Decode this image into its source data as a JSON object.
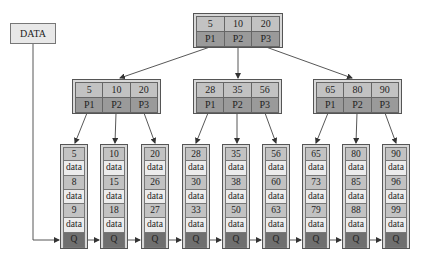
{
  "colors": {
    "key_cell": "#c2c2c2",
    "pointer_cell": "#9a9a9a",
    "data_cell": "#ececec",
    "q_cell": "#6f6f6f",
    "border": "#555555",
    "arrow": "#444444"
  },
  "data_label": "DATA",
  "root": {
    "keys": [
      "5",
      "10",
      "20"
    ],
    "pointers": [
      "P1",
      "P2",
      "P3"
    ]
  },
  "internal": [
    {
      "keys": [
        "5",
        "10",
        "20"
      ],
      "pointers": [
        "P1",
        "P2",
        "P3"
      ]
    },
    {
      "keys": [
        "28",
        "35",
        "56"
      ],
      "pointers": [
        "P1",
        "P2",
        "P3"
      ]
    },
    {
      "keys": [
        "65",
        "80",
        "90"
      ],
      "pointers": [
        "P1",
        "P2",
        "P3"
      ]
    }
  ],
  "leaves": [
    {
      "k1": "5",
      "d1": "data",
      "k2": "8",
      "d2": "data",
      "k3": "9",
      "d3": "data",
      "q": "Q"
    },
    {
      "k1": "10",
      "d1": "data",
      "k2": "15",
      "d2": "data",
      "k3": "18",
      "d3": "data",
      "q": "Q"
    },
    {
      "k1": "20",
      "d1": "data",
      "k2": "26",
      "d2": "data",
      "k3": "27",
      "d3": "data",
      "q": "Q"
    },
    {
      "k1": "28",
      "d1": "data",
      "k2": "30",
      "d2": "data",
      "k3": "33",
      "d3": "data",
      "q": "Q"
    },
    {
      "k1": "35",
      "d1": "data",
      "k2": "38",
      "d2": "data",
      "k3": "50",
      "d3": "data",
      "q": "Q"
    },
    {
      "k1": "56",
      "d1": "data",
      "k2": "60",
      "d2": "data",
      "k3": "63",
      "d3": "data",
      "q": "Q"
    },
    {
      "k1": "65",
      "d1": "data",
      "k2": "73",
      "d2": "data",
      "k3": "79",
      "d3": "data",
      "q": "Q"
    },
    {
      "k1": "80",
      "d1": "data",
      "k2": "85",
      "d2": "data",
      "k3": "88",
      "d3": "data",
      "q": "Q"
    },
    {
      "k1": "90",
      "d1": "data",
      "k2": "96",
      "d2": "data",
      "k3": "99",
      "d3": "data",
      "q": "Q"
    }
  ]
}
